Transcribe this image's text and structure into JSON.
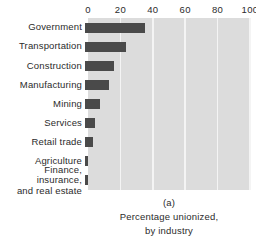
{
  "chart_data": {
    "type": "bar",
    "orientation": "horizontal",
    "title": "",
    "panel_id": "(a)",
    "caption_lines": [
      "Percentage unionized,",
      "by industry"
    ],
    "xlabel": "",
    "ylabel": "",
    "xlim": [
      0,
      100
    ],
    "xticks": [
      0,
      20,
      40,
      60,
      80,
      100
    ],
    "xtick_labels": [
      "0",
      "20",
      "40",
      "60",
      "80",
      "100"
    ],
    "grid": "vertical",
    "legend": "none",
    "categories": [
      "Government",
      "Transportation",
      "Construction",
      "Manufacturing",
      "Mining",
      "Services",
      "Retail trade",
      "Agriculture",
      "Finance, insurance,\nand real estate"
    ],
    "values": [
      37,
      25,
      18,
      15,
      9,
      6,
      5,
      2,
      2
    ],
    "colors": {
      "bar": "#4a4a4a",
      "plot_background": "#dcdcdc",
      "gridline": "#f4f4f4",
      "text": "#2b2b2b",
      "page_background": "#ffffff"
    }
  }
}
